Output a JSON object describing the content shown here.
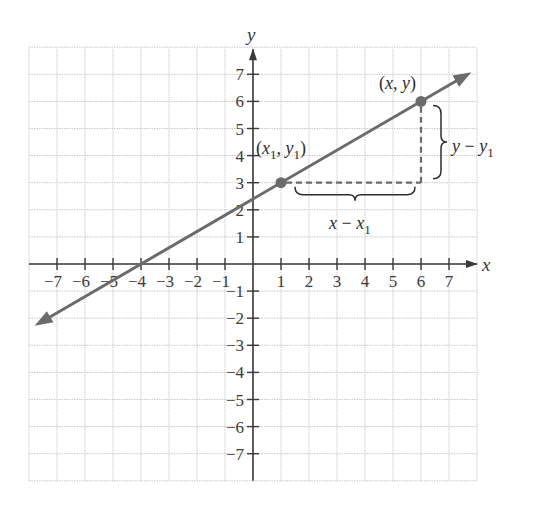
{
  "chart_data": {
    "type": "line",
    "title": "",
    "xlabel": "x",
    "ylabel": "y",
    "xlim": [
      -8,
      8
    ],
    "ylim": [
      -8,
      8
    ],
    "grid": true,
    "x_ticks": [
      -7,
      -6,
      -5,
      -4,
      -3,
      -2,
      -1,
      1,
      2,
      3,
      4,
      5,
      6,
      7
    ],
    "y_ticks": [
      -7,
      -6,
      -5,
      -4,
      -3,
      -2,
      -1,
      1,
      2,
      3,
      4,
      5,
      6,
      7
    ],
    "x_tick_labels": [
      "−7",
      "−6",
      "−5",
      "−4",
      "−3",
      "−2",
      "−1",
      "1",
      "2",
      "3",
      "4",
      "5",
      "6",
      "7"
    ],
    "y_tick_labels": [
      "−7",
      "−6",
      "−5",
      "−4",
      "−3",
      "−2",
      "−1",
      "1",
      "2",
      "3",
      "4",
      "5",
      "6",
      "7"
    ],
    "line": {
      "slope": 0.6,
      "intercept": 2.4,
      "x_start": -7.8,
      "x_end": 7.8,
      "arrows": "both",
      "color": "#6b6b6b"
    },
    "points": [
      {
        "name": "point-x1-y1",
        "x": 1,
        "y": 3,
        "label": "(x1, y1)",
        "label_parts": {
          "open": "(",
          "v1": "x",
          "s1": "1",
          "sep": ", ",
          "v2": "y",
          "s2": "1",
          "close": ")"
        }
      },
      {
        "name": "point-x-y",
        "x": 6,
        "y": 6,
        "label": "(x, y)",
        "label_parts": {
          "open": "(",
          "v1": "x",
          "sep": ", ",
          "v2": "y",
          "close": ")"
        }
      }
    ],
    "annotations": [
      {
        "name": "horizontal-run",
        "from": [
          1,
          3
        ],
        "to": [
          6,
          3
        ],
        "style": "dashed",
        "label": "x − x1",
        "label_parts": {
          "v": "x",
          "op": " − ",
          "v2": "x",
          "sub": "1"
        }
      },
      {
        "name": "vertical-rise",
        "from": [
          6,
          3
        ],
        "to": [
          6,
          6
        ],
        "style": "dashed",
        "label": "y − y1",
        "label_parts": {
          "v": "y",
          "op": " − ",
          "v2": "y",
          "sub": "1"
        }
      }
    ],
    "colors": {
      "axis": "#3a3a3a",
      "grid": "#c8c8c8",
      "line": "#6b6b6b",
      "point": "#6b6b6b",
      "dashed": "#6b6b6b"
    }
  }
}
